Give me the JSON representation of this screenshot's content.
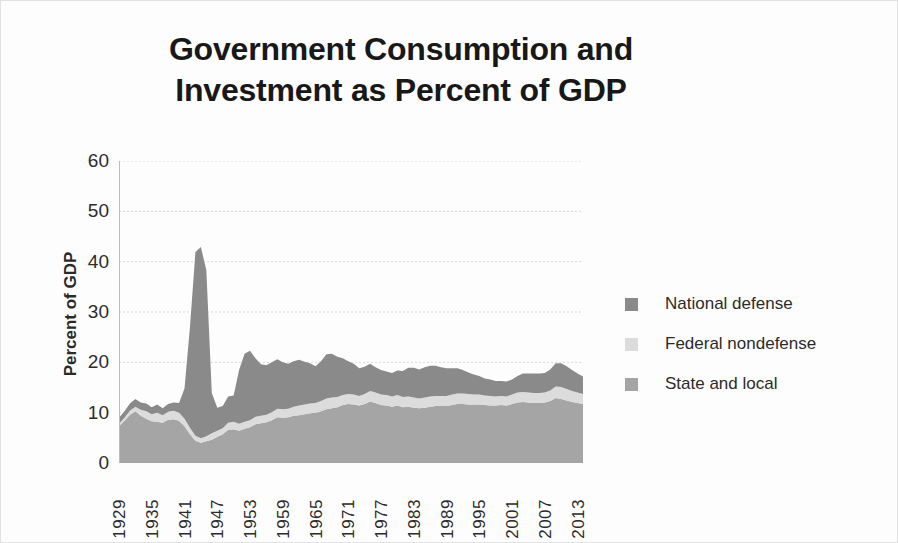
{
  "chart_data": {
    "type": "area",
    "stacked": true,
    "title": "Government Consumption and Investment as Percent of GDP",
    "title_lines": [
      "Government Consumption and",
      "Investment as Percent of GDP"
    ],
    "xlabel": "",
    "ylabel": "Percent of GDP",
    "ylim": [
      0,
      60
    ],
    "y_ticks": [
      60,
      50,
      40,
      30,
      20,
      10,
      0
    ],
    "xlim": [
      1929,
      2014
    ],
    "x_tick_labels": [
      "1929",
      "1935",
      "1941",
      "1947",
      "1953",
      "1959",
      "1965",
      "1971",
      "1977",
      "1983",
      "1989",
      "1995",
      "2001",
      "2007",
      "2013"
    ],
    "grid": true,
    "grid_axis": "y",
    "legend_position": "right",
    "x": [
      1929,
      1930,
      1931,
      1932,
      1933,
      1934,
      1935,
      1936,
      1937,
      1938,
      1939,
      1940,
      1941,
      1942,
      1943,
      1944,
      1945,
      1946,
      1947,
      1948,
      1949,
      1950,
      1951,
      1952,
      1953,
      1954,
      1955,
      1956,
      1957,
      1958,
      1959,
      1960,
      1961,
      1962,
      1963,
      1964,
      1965,
      1966,
      1967,
      1968,
      1969,
      1970,
      1971,
      1972,
      1973,
      1974,
      1975,
      1976,
      1977,
      1978,
      1979,
      1980,
      1981,
      1982,
      1983,
      1984,
      1985,
      1986,
      1987,
      1988,
      1989,
      1990,
      1991,
      1992,
      1993,
      1994,
      1995,
      1996,
      1997,
      1998,
      1999,
      2000,
      2001,
      2002,
      2003,
      2004,
      2005,
      2006,
      2007,
      2008,
      2009,
      2010,
      2011,
      2012,
      2013,
      2014
    ],
    "series": [
      {
        "name": "National defense",
        "color": "#8a8a8a",
        "values": [
          1.2,
          1.3,
          1.4,
          1.5,
          1.4,
          1.5,
          1.4,
          1.6,
          1.4,
          1.5,
          1.6,
          1.9,
          6.0,
          20.0,
          36.5,
          38.0,
          33.0,
          8.0,
          4.6,
          4.4,
          5.2,
          5.2,
          10.7,
          13.5,
          13.8,
          11.6,
          10.2,
          9.8,
          9.9,
          9.8,
          9.3,
          8.9,
          9.0,
          9.1,
          8.5,
          8.0,
          7.3,
          7.9,
          8.8,
          8.7,
          8.0,
          7.3,
          6.5,
          6.1,
          5.5,
          5.4,
          5.4,
          5.0,
          4.9,
          4.7,
          4.7,
          4.9,
          5.2,
          5.7,
          5.9,
          5.8,
          6.0,
          6.1,
          6.0,
          5.7,
          5.5,
          5.2,
          5.0,
          4.7,
          4.3,
          4.0,
          3.7,
          3.4,
          3.3,
          3.1,
          3.0,
          3.0,
          3.0,
          3.3,
          3.7,
          3.8,
          3.9,
          3.9,
          3.9,
          4.2,
          4.6,
          4.7,
          4.5,
          4.2,
          3.8,
          3.5
        ]
      },
      {
        "name": "Federal nondefense",
        "color": "#dcdcdc",
        "values": [
          0.5,
          0.6,
          0.8,
          0.9,
          1.2,
          1.5,
          1.4,
          1.8,
          1.5,
          1.6,
          1.7,
          1.6,
          1.5,
          1.3,
          1.0,
          0.9,
          1.0,
          1.3,
          1.2,
          1.2,
          1.4,
          1.5,
          1.4,
          1.4,
          1.4,
          1.5,
          1.5,
          1.5,
          1.6,
          1.7,
          1.7,
          1.7,
          1.8,
          1.9,
          1.9,
          1.9,
          1.9,
          2.0,
          2.1,
          2.1,
          2.0,
          2.0,
          2.0,
          2.0,
          1.9,
          2.0,
          2.1,
          2.1,
          2.1,
          2.1,
          2.0,
          2.1,
          2.0,
          2.0,
          2.0,
          1.9,
          2.0,
          2.0,
          2.0,
          2.0,
          2.0,
          2.1,
          2.1,
          2.1,
          2.1,
          2.0,
          2.0,
          1.9,
          1.9,
          1.8,
          1.8,
          1.8,
          1.9,
          2.0,
          2.0,
          2.0,
          2.0,
          2.0,
          2.0,
          2.1,
          2.3,
          2.4,
          2.3,
          2.2,
          2.1,
          2.0
        ]
      },
      {
        "name": "State and local",
        "color": "#a5a5a5",
        "values": [
          7.3,
          8.4,
          9.6,
          10.3,
          9.4,
          8.8,
          8.3,
          8.2,
          8.0,
          8.6,
          8.7,
          8.4,
          7.3,
          5.7,
          4.4,
          4.0,
          4.3,
          4.6,
          5.2,
          5.7,
          6.6,
          6.7,
          6.4,
          6.8,
          7.1,
          7.7,
          7.9,
          8.1,
          8.5,
          9.1,
          9.0,
          9.1,
          9.4,
          9.5,
          9.7,
          9.9,
          10.0,
          10.3,
          10.7,
          10.9,
          11.1,
          11.5,
          11.7,
          11.6,
          11.4,
          11.7,
          12.2,
          11.9,
          11.5,
          11.4,
          11.2,
          11.4,
          11.1,
          11.2,
          11.0,
          10.9,
          11.0,
          11.2,
          11.3,
          11.3,
          11.3,
          11.5,
          11.7,
          11.7,
          11.6,
          11.6,
          11.6,
          11.5,
          11.4,
          11.4,
          11.5,
          11.4,
          11.7,
          12.0,
          12.1,
          12.0,
          11.9,
          11.9,
          12.0,
          12.3,
          12.9,
          12.7,
          12.4,
          12.1,
          11.9,
          11.7
        ]
      }
    ]
  },
  "legend": {
    "items": [
      {
        "label": "National defense",
        "color": "#8a8a8a",
        "swatch_name": "legend-swatch-national-defense"
      },
      {
        "label": "Federal nondefense",
        "color": "#dcdcdc",
        "swatch_name": "legend-swatch-federal-nondefense"
      },
      {
        "label": "State and local",
        "color": "#a5a5a5",
        "swatch_name": "legend-swatch-state-and-local"
      }
    ]
  },
  "axes": {
    "y_title": "Percent of GDP",
    "y_ticks": [
      "60",
      "50",
      "40",
      "30",
      "20",
      "10",
      "0"
    ],
    "x_ticks": [
      "1929",
      "1935",
      "1941",
      "1947",
      "1953",
      "1959",
      "1965",
      "1971",
      "1977",
      "1983",
      "1989",
      "1995",
      "2001",
      "2007",
      "2013"
    ]
  }
}
